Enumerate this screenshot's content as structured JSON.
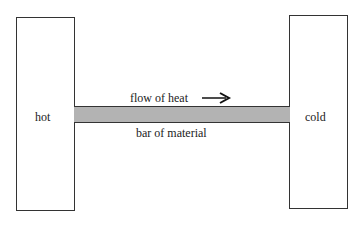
{
  "diagram": {
    "hot_reservoir": {
      "label": "hot"
    },
    "cold_reservoir": {
      "label": "cold"
    },
    "bar": {
      "label": "bar of material",
      "fill_color": "#b3b3b3"
    },
    "flow": {
      "label": "flow of heat",
      "direction": "right-arrow-icon"
    }
  }
}
